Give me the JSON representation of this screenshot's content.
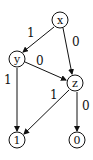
{
  "diagram": {
    "type": "binary-decision-diagram",
    "nodes": [
      {
        "id": "x",
        "label": "x",
        "cx": 60,
        "cy": 20
      },
      {
        "id": "y",
        "label": "y",
        "cx": 17,
        "cy": 59
      },
      {
        "id": "z",
        "label": "z",
        "cx": 75,
        "cy": 83
      },
      {
        "id": "one",
        "label": "1",
        "cx": 17,
        "cy": 140
      },
      {
        "id": "zero",
        "label": "0",
        "cx": 77,
        "cy": 140
      }
    ],
    "edges": [
      {
        "from": "x",
        "to": "y",
        "label": "1"
      },
      {
        "from": "x",
        "to": "z",
        "label": "0"
      },
      {
        "from": "y",
        "to": "z",
        "label": "0"
      },
      {
        "from": "y",
        "to": "one",
        "label": "1"
      },
      {
        "from": "z",
        "to": "one",
        "label": "1"
      },
      {
        "from": "z",
        "to": "zero",
        "label": "0"
      }
    ]
  }
}
